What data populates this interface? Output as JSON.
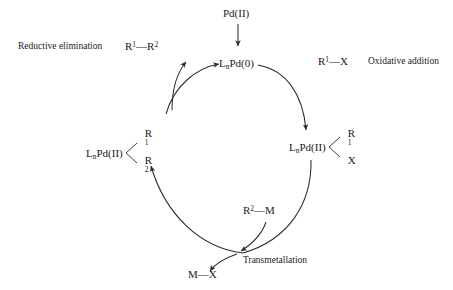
{
  "diagram": {
    "background_color": "#ffffff",
    "stroke_color": "#2b2b2b",
    "text_color": "#1a1a1a"
  },
  "species": {
    "precatalyst": {
      "main": "Pd(II)"
    },
    "active_catalyst": {
      "prefix": "L",
      "subscript": "n",
      "main": "Pd(0)"
    },
    "oxidative_addition_complex": {
      "prefix": "L",
      "subscript": "n",
      "main": "Pd(II)",
      "ligand_top": "R",
      "ligand_top_sup": "1",
      "ligand_bottom": "X",
      "ligand_bottom_sup": ""
    },
    "transmetallation_complex": {
      "prefix": "L",
      "subscript": "n",
      "main": "Pd(II)",
      "ligand_top": "R",
      "ligand_top_sup": "1",
      "ligand_bottom": "R",
      "ligand_bottom_sup": "2"
    },
    "product": {
      "left": "R",
      "left_sup": "1",
      "bond": "—",
      "right": "R",
      "right_sup": "2"
    },
    "organohalide": {
      "left": "R",
      "left_sup": "1",
      "bond": "—",
      "right": "X",
      "right_sup": ""
    },
    "organometallic": {
      "left": "R",
      "left_sup": "2",
      "bond": "—",
      "right": "M",
      "right_sup": ""
    },
    "metal_halide": {
      "left": "M",
      "left_sup": "",
      "bond": "—",
      "right": "X",
      "right_sup": ""
    }
  },
  "steps": {
    "reductive_elimination": "Reductive elimination",
    "oxidative_addition": "Oxidative addition",
    "transmetallation": "Transmetallation"
  }
}
